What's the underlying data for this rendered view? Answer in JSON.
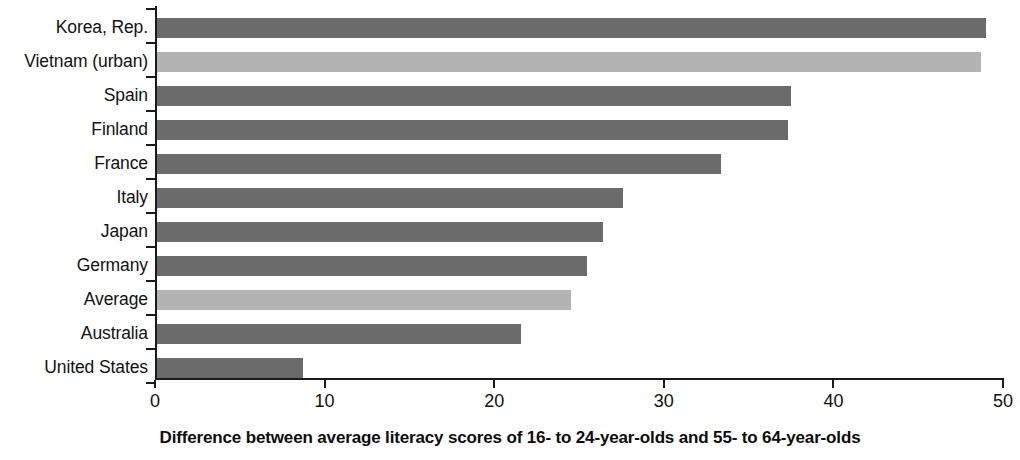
{
  "chart_data": {
    "type": "bar",
    "orientation": "horizontal",
    "title": "",
    "xlabel": "Difference between average literacy scores of 16- to 24-year-olds and 55- to 64-year-olds",
    "ylabel": "",
    "xlim": [
      0,
      50
    ],
    "xticks": [
      0,
      10,
      20,
      30,
      40,
      50
    ],
    "xtick_labels": [
      "0",
      "10",
      "20",
      "30",
      "40",
      "50"
    ],
    "grid": false,
    "legend": "none",
    "categories": [
      "Korea, Rep.",
      "Vietnam (urban)",
      "Spain",
      "Finland",
      "France",
      "Italy",
      "Japan",
      "Germany",
      "Average",
      "Australia",
      "United States"
    ],
    "values": [
      49.0,
      48.7,
      37.5,
      37.3,
      33.4,
      27.6,
      26.4,
      25.5,
      24.5,
      21.6,
      8.7
    ],
    "bar_colors": [
      "#6b6b6b",
      "#b3b3b3",
      "#6b6b6b",
      "#6b6b6b",
      "#6b6b6b",
      "#6b6b6b",
      "#6b6b6b",
      "#6b6b6b",
      "#b3b3b3",
      "#6b6b6b",
      "#6b6b6b"
    ],
    "colors": {
      "bar_primary": "#6b6b6b",
      "bar_highlight": "#b3b3b3",
      "axis": "#1a1a1a",
      "text": "#111111",
      "background": "#ffffff"
    }
  }
}
